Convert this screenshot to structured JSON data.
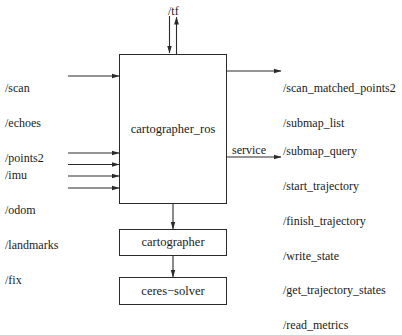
{
  "diagram": {
    "type": "block-diagram",
    "nodes": {
      "main": {
        "label": "cartographer_ros"
      },
      "core": {
        "label": "cartographer"
      },
      "solver": {
        "label": "ceres−solver"
      }
    },
    "top_topic": {
      "label": "/tf",
      "direction": "bidirectional"
    },
    "inputs": {
      "sensors_group_1": [
        "/scan",
        "/echoes",
        "/points2"
      ],
      "sensors_group_2": [
        "/imu",
        "/odom",
        "/landmarks",
        "/fix"
      ]
    },
    "outputs": {
      "topics": [
        "/scan_matched_points2",
        "/submap_list"
      ],
      "service_label": "service",
      "services": [
        "/submap_query",
        "/start_trajectory",
        "/finish_trajectory",
        "/write_state",
        "/get_trajectory_states",
        "/read_metrics"
      ]
    },
    "edges": [
      {
        "from": "main",
        "to": "core"
      },
      {
        "from": "core",
        "to": "solver"
      }
    ],
    "colors": {
      "line": "#2a2a2a",
      "text": "#1a1a1a",
      "background": "#ffffff"
    }
  }
}
